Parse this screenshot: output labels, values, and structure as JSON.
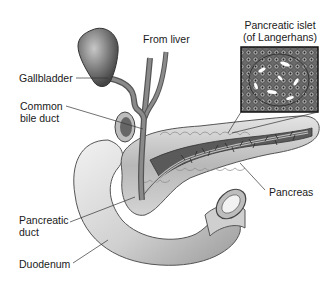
{
  "diagram": {
    "type": "anatomical-illustration",
    "style": "grayscale",
    "labels": {
      "from_liver": "From liver",
      "gallbladder": "Gallbladder",
      "common_bile_duct_line1": "Common",
      "common_bile_duct_line2": "bile duct",
      "pancreatic_islet_line1": "Pancreatic islet",
      "pancreatic_islet_line2": "(of Langerhans)",
      "pancreas": "Pancreas",
      "pancreatic_duct_line1": "Pancreatic",
      "pancreatic_duct_line2": "duct",
      "duodenum": "Duodenum"
    },
    "inset": {
      "title": "Pancreatic islet (of Langerhans)",
      "description": "magnified cluster of islet cells"
    },
    "colors": {
      "label_text": "#1a1a1a",
      "leader_line": "#333333",
      "organ_dark": "#4a4a4a",
      "organ_mid": "#9a9a9a",
      "organ_light": "#d8d8d8"
    }
  }
}
